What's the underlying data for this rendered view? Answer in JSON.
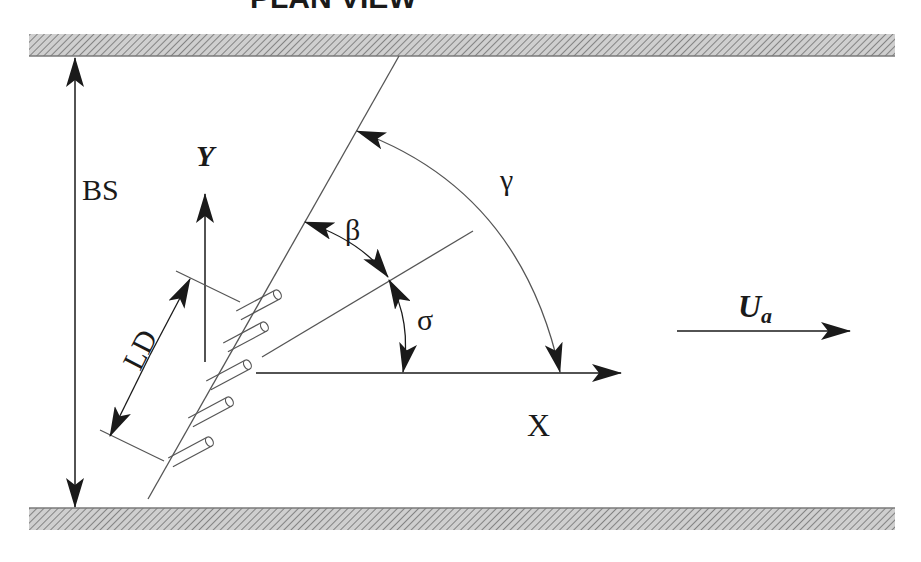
{
  "title": "PLAN VIEW",
  "labels": {
    "bs": "BS",
    "y_axis": "Y",
    "x_axis": "X",
    "ld": "LD",
    "beta": "β",
    "gamma": "γ",
    "sigma": "σ",
    "ua_main": "U",
    "ua_sub": "a"
  },
  "elements": {
    "walls": [
      "top-channel-wall",
      "bottom-channel-wall"
    ],
    "jets_count": 5
  },
  "colors": {
    "ink": "#1a1a1a",
    "hatch": "#8a8a8a",
    "thin_line": "#555555"
  }
}
